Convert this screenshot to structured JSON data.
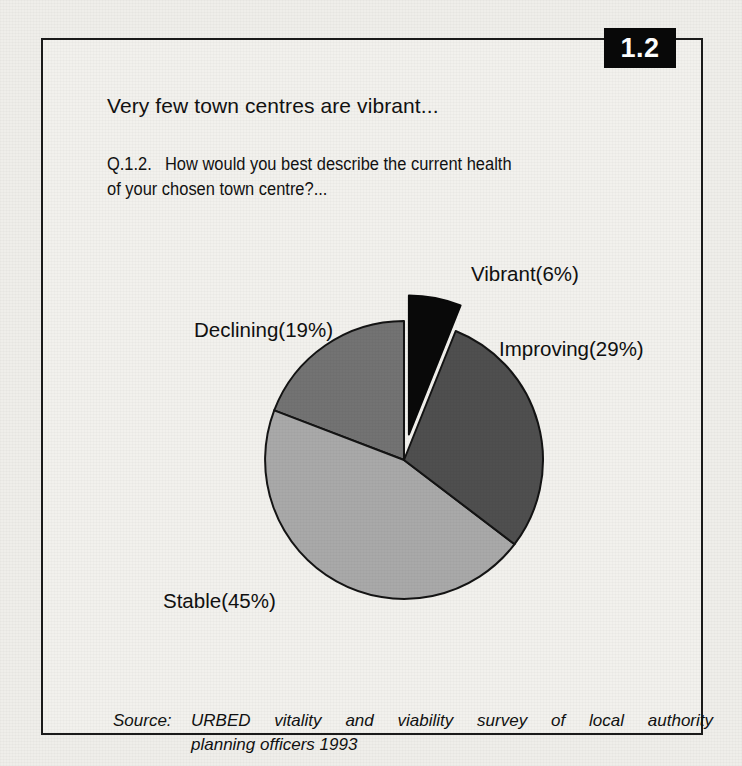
{
  "figure": {
    "number": "1.2",
    "headline": "Very few town centres are vibrant...",
    "question_prefix": "Q.1.2.",
    "question_line1": "How would you best describe the current health",
    "question_line2": "of your chosen town centre?...",
    "source_label": "Source:",
    "source_line1": "URBED vitality and viability survey of local authority",
    "source_line2": "planning officers 1993"
  },
  "chart_data": {
    "type": "pie",
    "title": "Very few town centres are vibrant...",
    "subtitle": "Q.1.2.  How would you best describe the current health of your chosen town centre?...",
    "categories": [
      "Vibrant",
      "Improving",
      "Stable",
      "Declining"
    ],
    "values": [
      6,
      29,
      45,
      19
    ],
    "unit": "%",
    "labels": [
      "Vibrant(6%)",
      "Improving(29%)",
      "Stable(45%)",
      "Declining(19%)"
    ],
    "slice_colors": [
      "#090909",
      "#4f4f4f",
      "#a9a9a9",
      "#737373"
    ],
    "exploded": [
      "Vibrant"
    ],
    "start_angle_deg": 0,
    "direction": "clockwise",
    "legend": "none",
    "grid": false,
    "source": "URBED vitality and viability survey of local authority planning officers 1993"
  },
  "slices": [
    {
      "name": "Vibrant",
      "label": "Vibrant(6%)",
      "value": 6,
      "color": "#090909"
    },
    {
      "name": "Improving",
      "label": "Improving(29%)",
      "value": 29,
      "color": "#4f4f4f"
    },
    {
      "name": "Stable",
      "label": "Stable(45%)",
      "value": 45,
      "color": "#a9a9a9"
    },
    {
      "name": "Declining",
      "label": "Declining(19%)",
      "value": 19,
      "color": "#737373"
    }
  ]
}
